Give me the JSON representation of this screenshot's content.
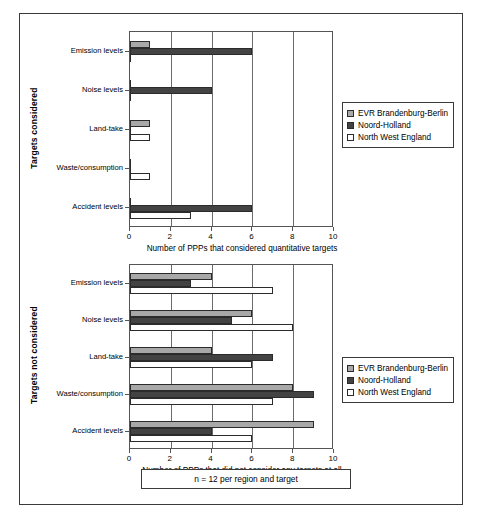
{
  "figure": {
    "footnote": "n = 12 per region and target",
    "series_colors": {
      "evr_brandenburg_berlin": "#a8a8a8",
      "noord_holland": "#434343",
      "north_west_england": "#ffffff"
    }
  },
  "legend": {
    "entries": [
      {
        "label": "EVR Brandenburg-Berlin",
        "swatch": "legend-swatch-evr"
      },
      {
        "label": "Noord-Holland",
        "swatch": "legend-swatch-noord-holland"
      },
      {
        "label": "North West England",
        "swatch": "legend-swatch-north-west-england"
      }
    ]
  },
  "chart_data": [
    {
      "type": "bar",
      "orientation": "horizontal",
      "title": "",
      "ylabel": "Targets considered",
      "xlabel": "Number of PPPs that considered quantitative targets",
      "categories": [
        "Emission levels",
        "Noise levels",
        "Land-take",
        "Waste/consumption",
        "Accident levels"
      ],
      "xlim": [
        0,
        10
      ],
      "xticks": [
        0,
        2,
        4,
        6,
        8,
        10
      ],
      "xticklabels": [
        "0",
        "2",
        "4",
        "6",
        "8",
        "10"
      ],
      "grid": true,
      "legend_position": "right",
      "series": [
        {
          "name": "EVR Brandenburg-Berlin",
          "values": [
            1,
            0,
            1,
            0,
            0
          ]
        },
        {
          "name": "Noord-Holland",
          "values": [
            6,
            4,
            0,
            0,
            6
          ]
        },
        {
          "name": "North West England",
          "values": [
            0,
            0,
            1,
            1,
            3
          ]
        }
      ]
    },
    {
      "type": "bar",
      "orientation": "horizontal",
      "title": "",
      "ylabel": "Targets not considered",
      "xlabel": "Number of PPPs that did not consider any targets at all",
      "categories": [
        "Emission levels",
        "Noise levels",
        "Land-take",
        "Waste/consumption",
        "Accident levels"
      ],
      "xlim": [
        0,
        10
      ],
      "xticks": [
        0,
        2,
        4,
        6,
        8,
        10
      ],
      "xticklabels": [
        "0",
        "2",
        "4",
        "6",
        "8",
        "10"
      ],
      "grid": true,
      "legend_position": "right",
      "series": [
        {
          "name": "EVR Brandenburg-Berlin",
          "values": [
            4,
            6,
            4,
            8,
            9
          ]
        },
        {
          "name": "Noord-Holland",
          "values": [
            3,
            5,
            7,
            9,
            4
          ]
        },
        {
          "name": "North West England",
          "values": [
            7,
            8,
            6,
            7,
            6
          ]
        }
      ]
    }
  ]
}
